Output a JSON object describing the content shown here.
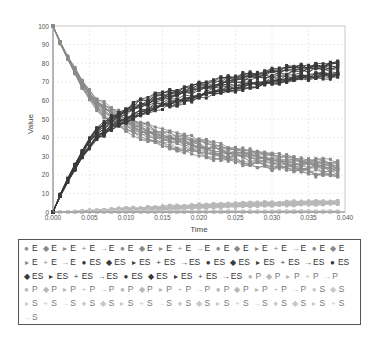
{
  "chart_data": {
    "type": "line",
    "title": "",
    "xlabel": "Time",
    "ylabel": "Value",
    "xlim": [
      0,
      0.04
    ],
    "ylim": [
      0,
      100
    ],
    "x_ticks": [
      "0.000",
      "0.005",
      "0.010",
      "0.015",
      "0.020",
      "0.025",
      "0.030",
      "0.035",
      "0.040"
    ],
    "y_ticks": [
      "0",
      "10",
      "20",
      "30",
      "40",
      "50",
      "60",
      "70",
      "80",
      "90",
      "100"
    ],
    "grid": true,
    "legend_position": "bottom",
    "x": [
      0.0,
      0.001,
      0.002,
      0.003,
      0.004,
      0.005,
      0.006,
      0.007,
      0.008,
      0.009,
      0.01,
      0.011,
      0.012,
      0.013,
      0.014,
      0.015,
      0.016,
      0.017,
      0.018,
      0.019,
      0.02,
      0.021,
      0.022,
      0.023,
      0.024,
      0.025,
      0.026,
      0.027,
      0.028,
      0.029,
      0.03,
      0.031,
      0.032,
      0.033,
      0.034,
      0.035,
      0.036,
      0.037,
      0.038,
      0.039
    ],
    "series_groups": [
      {
        "name": "E",
        "runs": 20,
        "color": "#8a8a8a",
        "description": "decays from 100 to ~20-28",
        "mean": [
          100,
          91,
          83,
          76,
          69,
          63,
          58,
          55,
          52,
          50,
          48,
          46,
          44,
          43,
          41,
          40,
          39,
          38,
          37,
          36,
          35,
          34,
          33,
          32,
          31,
          31,
          30,
          29,
          29,
          28,
          27,
          27,
          26,
          26,
          25,
          25,
          24,
          24,
          24,
          23
        ],
        "spread": 4
      },
      {
        "name": "ES",
        "runs": 20,
        "color": "#3a3a3a",
        "description": "rises from 0 to ~73-82",
        "mean": [
          0,
          9,
          17,
          24,
          31,
          37,
          42,
          45,
          48,
          50,
          52,
          54,
          56,
          57,
          59,
          60,
          61,
          62,
          63,
          64,
          65,
          66,
          67,
          68,
          69,
          69,
          70,
          71,
          71,
          72,
          73,
          73,
          74,
          74,
          75,
          75,
          76,
          76,
          76,
          77
        ],
        "spread": 4
      },
      {
        "name": "P",
        "runs": 20,
        "color": "#b8b8b8",
        "description": "slowly rises from 0 to ~5",
        "mean": [
          0,
          0,
          0,
          0,
          0.2,
          0.3,
          0.5,
          0.6,
          0.8,
          1,
          1.1,
          1.3,
          1.5,
          1.7,
          1.9,
          2.1,
          2.3,
          2.5,
          2.7,
          2.9,
          3.1,
          3.2,
          3.4,
          3.5,
          3.7,
          3.8,
          4,
          4.1,
          4.2,
          4.3,
          4.4,
          4.5,
          4.6,
          4.7,
          4.8,
          4.9,
          5,
          5,
          5.1,
          5.2
        ],
        "spread": 1
      },
      {
        "name": "S",
        "runs": 20,
        "color": "#c8c8c8",
        "description": "near zero",
        "mean": [
          0,
          0,
          0,
          0,
          0,
          0,
          0,
          0,
          0,
          0,
          0,
          0,
          0,
          0,
          0,
          0,
          0,
          0,
          0,
          0,
          0,
          0,
          0,
          0,
          0,
          0,
          0,
          0,
          0,
          0,
          0,
          0,
          0,
          0,
          0,
          0,
          0,
          0,
          0,
          0
        ],
        "spread": 0.5
      }
    ],
    "legend": {
      "entries_per_group": 20,
      "groups": [
        "E",
        "ES",
        "P",
        "S"
      ],
      "markers": [
        "●",
        "◆",
        "▸",
        "+",
        "→"
      ]
    }
  }
}
